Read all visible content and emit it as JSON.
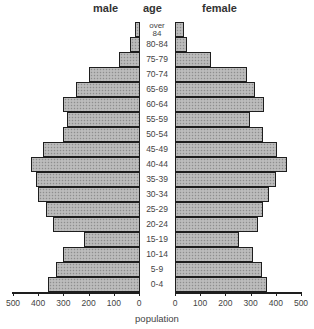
{
  "headers": {
    "male": "male",
    "age": "age",
    "female": "female"
  },
  "chart_data": {
    "type": "bar",
    "subtype": "population-pyramid",
    "title": "",
    "xlabel": "population",
    "ylabel": "age",
    "categories": [
      "over 84",
      "80-84",
      "75-79",
      "70-74",
      "65-69",
      "60-64",
      "55-59",
      "50-54",
      "45-49",
      "40-44",
      "35-39",
      "30-34",
      "25-29",
      "20-24",
      "15-19",
      "10-14",
      "5-9",
      "0-4"
    ],
    "series": [
      {
        "name": "male",
        "values": [
          15,
          35,
          80,
          200,
          250,
          300,
          285,
          300,
          380,
          430,
          410,
          400,
          370,
          340,
          220,
          300,
          330,
          360
        ]
      },
      {
        "name": "female",
        "values": [
          30,
          45,
          140,
          280,
          315,
          350,
          295,
          345,
          400,
          440,
          395,
          370,
          345,
          325,
          250,
          305,
          340,
          360
        ]
      }
    ],
    "xlim": [
      0,
      500
    ],
    "x_ticks": [
      0,
      100,
      200,
      300,
      400,
      500
    ],
    "x_tick_labels": [
      "0",
      "100",
      "200",
      "300",
      "400",
      "500"
    ],
    "grid": false,
    "legend": "none (panel headers 'male' and 'female')",
    "fill": "stippled gray",
    "colors": {
      "bar_fill": "#b4b4b4",
      "bar_border": "#1e1e1e",
      "axis": "#1e1e1e"
    }
  }
}
